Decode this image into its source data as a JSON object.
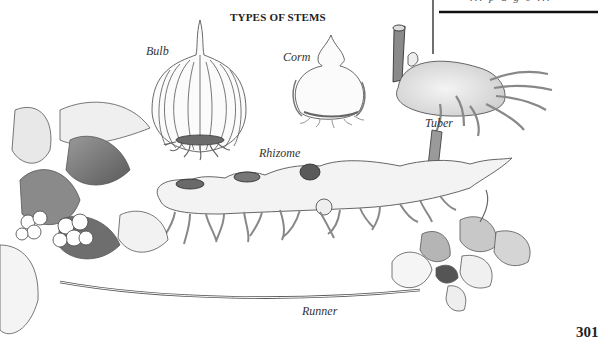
{
  "figure": {
    "title": "TYPES OF STEMS",
    "labels": {
      "bulb": "Bulb",
      "corm": "Corm",
      "tuber": "Tuber",
      "rhizome": "Rhizome",
      "runner": "Runner"
    }
  },
  "sidebar_box": {
    "cut_text": "... p a g e ..."
  },
  "page": {
    "number": "301"
  }
}
